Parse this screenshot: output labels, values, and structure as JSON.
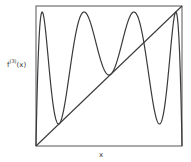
{
  "chart_data": {
    "type": "line",
    "title": "",
    "xlabel": "x",
    "ylabel": "f^(3)(x)",
    "ylabel_base": "f",
    "ylabel_sup": "(3)",
    "ylabel_arg": "(x)",
    "xlim": [
      0,
      1
    ],
    "ylim": [
      0,
      1
    ],
    "grid": false,
    "legend": null,
    "function": "third iterate of logistic map f(x) = r x (1 - x)",
    "r": 3.8284,
    "series": [
      {
        "name": "f^(3)(x)",
        "kind": "curve",
        "samples": 600
      },
      {
        "name": "y = x",
        "kind": "line",
        "x": [
          0,
          1
        ],
        "y": [
          0,
          1
        ]
      }
    ],
    "approx_tangent_points_x": [
      0.16,
      0.51,
      0.96
    ],
    "approx_peaks_x": [
      0.04,
      0.34,
      0.67,
      0.99
    ],
    "approx_troughs_x": [
      0.16,
      0.51,
      0.85
    ]
  },
  "style": {
    "line_color": "#3a3a3a",
    "frame_color": "#555555",
    "background": "#ffffff"
  },
  "layout": {
    "frame": {
      "left": 36,
      "top": 6,
      "right": 182,
      "bottom": 146
    }
  }
}
